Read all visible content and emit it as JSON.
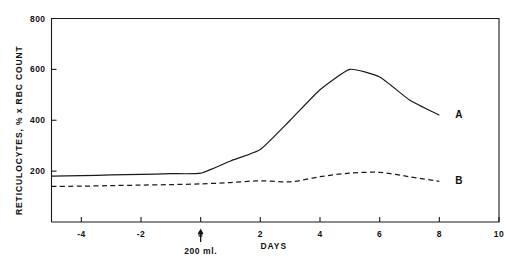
{
  "chart_data": {
    "type": "line",
    "title": "",
    "xlabel": "DAYS",
    "ylabel": "RETICULOCYTES, % x RBC COUNT",
    "xlim": [
      -5,
      10
    ],
    "ylim": [
      0,
      800
    ],
    "grid": false,
    "legend_position": "inline-right-end-of-line",
    "xticks": [
      -4,
      -2,
      0,
      2,
      4,
      6,
      8,
      10
    ],
    "xtick_labels": [
      "-4",
      "-2",
      "0",
      "2",
      "4",
      "6",
      "8",
      "10"
    ],
    "yticks": [
      200,
      400,
      600,
      800
    ],
    "ytick_labels": [
      "200",
      "400",
      "600",
      "800"
    ],
    "annotations": [
      {
        "name": "transfusion-arrow-annotation",
        "label": "200 ml.",
        "x": 0,
        "marker": "up-arrow"
      }
    ],
    "series": [
      {
        "name": "A",
        "label": "A",
        "style": "solid",
        "color": "#1a1a1a",
        "x": [
          -5,
          -4,
          -3,
          -2,
          -1,
          0,
          1,
          2,
          3,
          4,
          5,
          6,
          7,
          8
        ],
        "values": [
          180,
          182,
          185,
          187,
          190,
          192,
          240,
          285,
          400,
          520,
          600,
          570,
          480,
          420
        ]
      },
      {
        "name": "B",
        "label": "B",
        "style": "dashed",
        "color": "#1a1a1a",
        "x": [
          -5,
          -4,
          -3,
          -2,
          -1,
          0,
          1,
          2,
          3,
          4,
          5,
          6,
          7,
          8
        ],
        "values": [
          140,
          141,
          143,
          145,
          147,
          150,
          155,
          162,
          158,
          178,
          192,
          195,
          178,
          160
        ]
      }
    ]
  }
}
